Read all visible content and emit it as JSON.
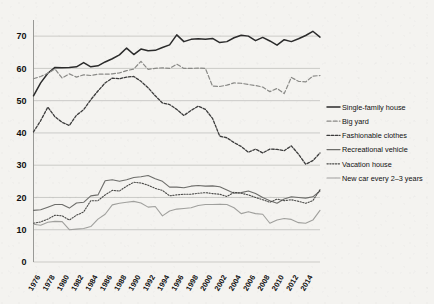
{
  "chart_data": {
    "type": "line",
    "title": "",
    "subtitle": "",
    "xlabel": "",
    "ylabel": "",
    "ylim": [
      0,
      75
    ],
    "yticks": [
      0,
      10,
      20,
      30,
      40,
      50,
      60,
      70
    ],
    "grid": true,
    "legend_position": "right",
    "x": [
      1975,
      1976,
      1977,
      1978,
      1979,
      1980,
      1981,
      1982,
      1983,
      1984,
      1985,
      1986,
      1987,
      1988,
      1989,
      1990,
      1991,
      1992,
      1993,
      1994,
      1995,
      1996,
      1997,
      1998,
      1999,
      2000,
      2001,
      2002,
      2003,
      2004,
      2005,
      2006,
      2007,
      2008,
      2009,
      2010,
      2011,
      2012,
      2013,
      2014,
      2015
    ],
    "xtick_labels": [
      "1976",
      "1978",
      "1980",
      "1982",
      "1984",
      "1986",
      "1988",
      "1990",
      "1992",
      "1994",
      "1996",
      "1998",
      "2000",
      "2002",
      "2004",
      "2006",
      "2008",
      "2010",
      "2012",
      "2014"
    ],
    "series": [
      {
        "name": "Single-family house",
        "color": "#2b2b2b",
        "style": "solid",
        "width": 1.5,
        "values": [
          51.5,
          55.5,
          58.5,
          60.3,
          60.2,
          60.3,
          60.5,
          61.8,
          60.5,
          60.8,
          62.0,
          63.0,
          64.2,
          66.3,
          64.3,
          66.0,
          65.5,
          65.6,
          66.5,
          67.3,
          70.4,
          68.3,
          69.0,
          69.2,
          69.0,
          69.3,
          68.0,
          68.3,
          69.5,
          70.3,
          70.0,
          68.6,
          69.6,
          68.5,
          67.2,
          68.9,
          68.3,
          69.2,
          70.2,
          71.5,
          69.7
        ]
      },
      {
        "name": "Big yard",
        "color": "#8a8a87",
        "style": "dashed",
        "width": 1.2,
        "values": [
          56.8,
          57.5,
          58.5,
          59.8,
          57.0,
          58.3,
          57.3,
          58.0,
          57.8,
          58.2,
          58.2,
          58.3,
          58.6,
          59.3,
          59.8,
          62.2,
          59.7,
          60.0,
          60.2,
          60.0,
          61.3,
          60.0,
          60.0,
          60.1,
          60.0,
          54.5,
          54.4,
          54.8,
          55.5,
          55.4,
          55.0,
          54.7,
          54.2,
          52.8,
          53.8,
          52.2,
          57.2,
          56.0,
          55.8,
          57.6,
          57.8
        ]
      },
      {
        "name": "Fashionable clothes",
        "color": "#3c3c3c",
        "style": "dotted-dash",
        "width": 1.3,
        "values": [
          40.3,
          43.8,
          48.0,
          45.0,
          43.3,
          42.3,
          45.5,
          47.2,
          50.3,
          53.0,
          55.5,
          57.0,
          56.8,
          57.3,
          57.5,
          56.0,
          54.0,
          51.5,
          49.3,
          48.8,
          47.3,
          45.4,
          47.0,
          48.3,
          47.3,
          44.5,
          39.0,
          38.5,
          37.0,
          35.8,
          34.0,
          35.0,
          33.8,
          35.0,
          34.9,
          34.5,
          36.0,
          33.4,
          30.3,
          31.4,
          33.8
        ]
      },
      {
        "name": "Recreational vehicle",
        "color": "#6d6d6a",
        "style": "solid",
        "width": 1.1,
        "values": [
          16.0,
          16.2,
          17.0,
          17.8,
          17.8,
          16.7,
          18.3,
          18.5,
          20.5,
          20.8,
          25.2,
          25.5,
          25.0,
          25.5,
          26.2,
          26.4,
          26.8,
          25.8,
          25.0,
          23.2,
          23.2,
          23.0,
          23.5,
          23.7,
          23.5,
          23.6,
          23.3,
          22.3,
          21.3,
          21.5,
          22.0,
          21.2,
          20.0,
          19.0,
          18.2,
          19.5,
          20.2,
          20.0,
          19.8,
          20.2,
          22.0
        ]
      },
      {
        "name": "Vacation house",
        "color": "#4a4a48",
        "style": "dotted",
        "width": 1.1,
        "values": [
          12.0,
          12.4,
          13.3,
          14.5,
          14.3,
          13.0,
          14.5,
          15.5,
          19.0,
          19.0,
          20.8,
          22.2,
          22.0,
          23.5,
          24.7,
          24.5,
          23.8,
          22.8,
          22.2,
          20.5,
          20.8,
          21.0,
          21.0,
          21.3,
          21.5,
          21.2,
          21.0,
          20.3,
          21.6,
          21.3,
          20.8,
          20.0,
          19.3,
          18.5,
          19.5,
          19.0,
          19.3,
          18.8,
          18.2,
          19.0,
          22.4
        ]
      },
      {
        "name": "New car every 2–3 years",
        "color": "#a0a09d",
        "style": "solid",
        "width": 1.1,
        "values": [
          11.7,
          11.4,
          12.3,
          12.6,
          12.5,
          10.0,
          10.2,
          10.4,
          11.0,
          13.3,
          14.8,
          17.7,
          18.2,
          18.5,
          18.8,
          18.3,
          17.0,
          17.2,
          14.3,
          15.8,
          16.4,
          16.6,
          16.8,
          17.5,
          17.8,
          17.8,
          17.9,
          17.8,
          16.8,
          15.0,
          15.6,
          15.0,
          14.8,
          12.0,
          13.0,
          13.5,
          13.2,
          12.2,
          12.0,
          13.0,
          16.0
        ]
      }
    ]
  }
}
